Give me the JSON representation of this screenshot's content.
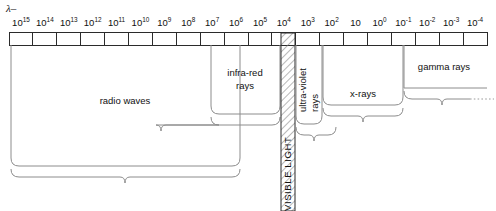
{
  "diagram": {
    "axis_symbol": "λ–",
    "axis_symbol_name": "wavelength-lambda"
  },
  "axis": {
    "name": "wavelength-scale",
    "direction": "decreasing-left-to-right",
    "tick_labels": [
      {
        "mantissa": "10",
        "exponent": "15"
      },
      {
        "mantissa": "10",
        "exponent": "14"
      },
      {
        "mantissa": "10",
        "exponent": "13"
      },
      {
        "mantissa": "10",
        "exponent": "12"
      },
      {
        "mantissa": "10",
        "exponent": "11"
      },
      {
        "mantissa": "10",
        "exponent": "10"
      },
      {
        "mantissa": "10",
        "exponent": "9"
      },
      {
        "mantissa": "10",
        "exponent": "8"
      },
      {
        "mantissa": "10",
        "exponent": "7"
      },
      {
        "mantissa": "10",
        "exponent": "6"
      },
      {
        "mantissa": "10",
        "exponent": "5"
      },
      {
        "mantissa": "10",
        "exponent": "4"
      },
      {
        "mantissa": "10",
        "exponent": "3"
      },
      {
        "mantissa": "10",
        "exponent": "2"
      },
      {
        "mantissa": "10",
        "exponent": ""
      },
      {
        "mantissa": "10",
        "exponent": "0"
      },
      {
        "mantissa": "10",
        "exponent": "-1"
      },
      {
        "mantissa": "10",
        "exponent": "-2"
      },
      {
        "mantissa": "10",
        "exponent": "-3"
      },
      {
        "mantissa": "10",
        "exponent": "-4"
      }
    ]
  },
  "bands": {
    "radio": {
      "label": "radio waves",
      "name": "band-radio-waves"
    },
    "infrared": {
      "label_line1": "infra-red",
      "label_line2": "rays",
      "name": "band-infra-red-rays"
    },
    "visible": {
      "label": "VISIBLE LIGHT",
      "name": "band-visible-light",
      "pattern": "diagonal-hatch"
    },
    "ultraviolet": {
      "label_line1": "ultra-violet",
      "label_line2": "rays",
      "name": "band-ultra-violet-rays"
    },
    "xrays": {
      "label": "x-rays",
      "name": "band-x-rays"
    },
    "gamma": {
      "label": "gamma rays",
      "name": "band-gamma-rays"
    }
  },
  "colors": {
    "axis_stroke": "#2b2b2b",
    "box_stroke": "#8c8c8c",
    "text": "#111111",
    "background": "#ffffff"
  },
  "chart_data": {
    "type": "bar",
    "xlabel": "λ–",
    "ylabel": "",
    "categories": [
      "radio waves",
      "infra-red rays",
      "VISIBLE LIGHT",
      "ultra-violet rays",
      "x-rays",
      "gamma rays"
    ],
    "values": [
      1,
      1,
      1,
      1,
      1,
      1
    ],
    "grid": false,
    "legend": "none",
    "axis_tick_text": [
      "10^15",
      "10^14",
      "10^13",
      "10^12",
      "10^11",
      "10^10",
      "10^9",
      "10^8",
      "10^7",
      "10^6",
      "10^5",
      "10^4",
      "10^3",
      "10^2",
      "10",
      "10^0",
      "10^-1",
      "10^-2",
      "10^-3",
      "10^-4"
    ],
    "annotations": [
      "radio waves",
      "infra-red rays",
      "VISIBLE LIGHT",
      "ultra-violet rays",
      "x-rays",
      "gamma rays"
    ]
  }
}
